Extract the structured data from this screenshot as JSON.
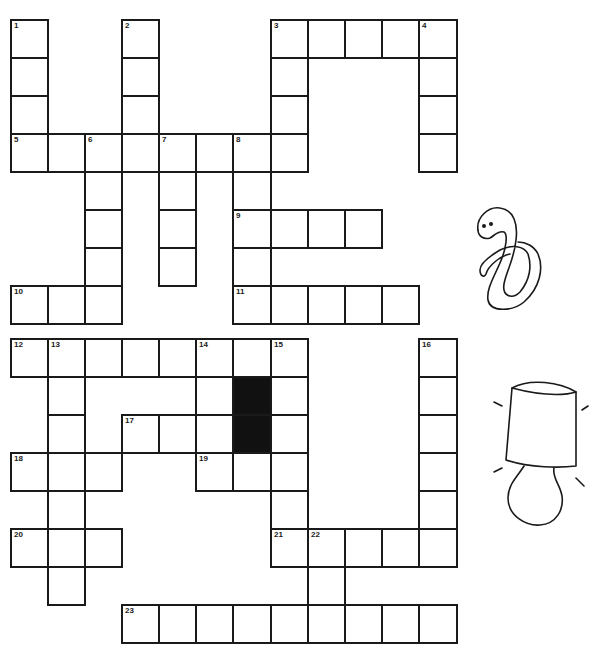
{
  "puzzle": {
    "cell_size": 37.5,
    "col_x": [
      10,
      47,
      84,
      121,
      158,
      195,
      232,
      270,
      307,
      344,
      381,
      418
    ],
    "row_y": [
      19,
      57,
      95,
      133,
      171,
      209,
      247,
      285,
      338,
      376,
      414,
      452,
      490,
      528,
      566,
      604
    ],
    "clues": [
      {
        "number": "1",
        "dir": "down",
        "col": 0,
        "row": 0,
        "length": 4
      },
      {
        "number": "2",
        "dir": "down",
        "col": 3,
        "row": 0,
        "length": 4
      },
      {
        "number": "3",
        "dir": "across",
        "col": 7,
        "row": 0,
        "length": 5
      },
      {
        "number": "3",
        "dir": "down",
        "col": 7,
        "row": 0,
        "length": 4
      },
      {
        "number": "4",
        "dir": "down",
        "col": 11,
        "row": 0,
        "length": 4
      },
      {
        "number": "5",
        "dir": "across",
        "col": 0,
        "row": 3,
        "length": 8
      },
      {
        "number": "6",
        "dir": "down",
        "col": 2,
        "row": 3,
        "length": 5
      },
      {
        "number": "7",
        "dir": "down",
        "col": 4,
        "row": 3,
        "length": 4
      },
      {
        "number": "8",
        "dir": "down",
        "col": 6,
        "row": 3,
        "length": 5
      },
      {
        "number": "9",
        "dir": "across",
        "col": 6,
        "row": 5,
        "length": 4
      },
      {
        "number": "10",
        "dir": "across",
        "col": 0,
        "row": 7,
        "length": 3
      },
      {
        "number": "11",
        "dir": "across",
        "col": 6,
        "row": 7,
        "length": 5
      },
      {
        "number": "12",
        "dir": "across",
        "col": 0,
        "row": 8,
        "length": 8
      },
      {
        "number": "13",
        "dir": "down",
        "col": 1,
        "row": 8,
        "length": 7
      },
      {
        "number": "14",
        "dir": "down",
        "col": 5,
        "row": 8,
        "length": 4
      },
      {
        "number": "15",
        "dir": "down",
        "col": 7,
        "row": 8,
        "length": 6
      },
      {
        "number": "16",
        "dir": "down",
        "col": 11,
        "row": 8,
        "length": 6
      },
      {
        "number": "17",
        "dir": "across",
        "col": 3,
        "row": 10,
        "length": 3
      },
      {
        "number": "18",
        "dir": "across",
        "col": 0,
        "row": 11,
        "length": 3
      },
      {
        "number": "19",
        "dir": "across",
        "col": 5,
        "row": 11,
        "length": 3
      },
      {
        "number": "20",
        "dir": "across",
        "col": 0,
        "row": 13,
        "length": 3
      },
      {
        "number": "21",
        "dir": "across",
        "col": 7,
        "row": 13,
        "length": 5
      },
      {
        "number": "22",
        "dir": "down",
        "col": 8,
        "row": 13,
        "length": 3
      },
      {
        "number": "23",
        "dir": "across",
        "col": 3,
        "row": 15,
        "length": 9
      }
    ],
    "black_cells": [
      {
        "col": 6,
        "row": 8
      },
      {
        "col": 6,
        "row": 11
      }
    ],
    "shaded_cells": [
      {
        "col": 6,
        "row": 9
      },
      {
        "col": 6,
        "row": 10
      }
    ],
    "colors": {
      "line": "#1a1a1a",
      "fill": "#ffffff",
      "black": "#111111"
    }
  },
  "illustrations": [
    {
      "name": "snake-illustration",
      "x": 470,
      "y": 200,
      "w": 90,
      "h": 115
    },
    {
      "name": "lamp-illustration",
      "x": 490,
      "y": 380,
      "w": 100,
      "h": 150
    }
  ]
}
